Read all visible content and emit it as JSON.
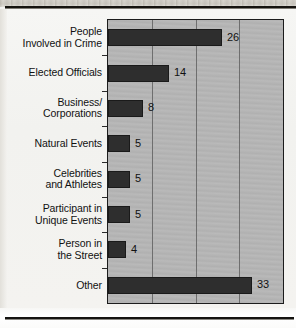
{
  "chart_data": {
    "type": "bar",
    "orientation": "horizontal",
    "title": "",
    "xlabel": "",
    "ylabel": "",
    "xlim": [
      0,
      40
    ],
    "gridlines": [
      10,
      20,
      30
    ],
    "grid": true,
    "legend": null,
    "categories": [
      "People\nInvolved in Crime",
      "Elected Officials",
      "Business/\nCorporations",
      "Natural Events",
      "Celebrities\nand Athletes",
      "Participant in\nUnique Events",
      "Person in\nthe Street",
      "Other"
    ],
    "values": [
      26,
      14,
      8,
      5,
      5,
      5,
      4,
      33
    ],
    "value_labels": [
      "26",
      "14",
      "8",
      "5",
      "5",
      "5",
      "4",
      "33"
    ],
    "colors": {
      "bar": "#2e2e2e",
      "plot_background": "#b6b6b6",
      "gridline": "#6e6e6e",
      "axis": "#1c1c1c",
      "text": "#111111",
      "page": "#f3f3f1"
    }
  }
}
